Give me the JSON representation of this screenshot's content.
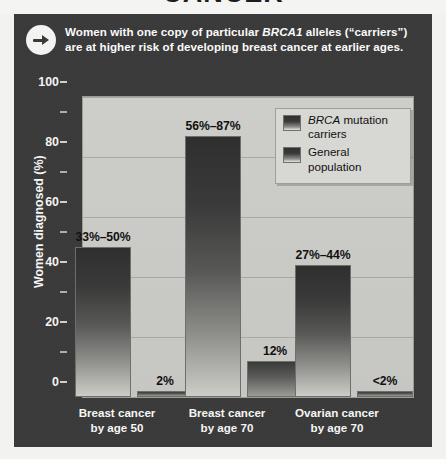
{
  "page": {
    "clipped_title": "CANCER"
  },
  "callout": {
    "icon": "arrow-right-circle-icon",
    "text_part1": "Women with one copy of particular ",
    "text_italic": "BRCA1",
    "text_part2": " alleles (“carriers”) are at higher risk of developing breast cancer at earlier ages."
  },
  "legend": {
    "items": [
      {
        "label_italic": "BRCA",
        "label_rest": " mutation carriers",
        "color": "#303030"
      },
      {
        "label_italic": "",
        "label_rest": "General population",
        "color": "#303030"
      }
    ]
  },
  "chart_data": {
    "type": "bar",
    "title": "CANCER",
    "xlabel": "",
    "ylabel": "Women diagnosed (%)",
    "ylim": [
      0,
      100
    ],
    "yticks": [
      0,
      20,
      40,
      60,
      80,
      100
    ],
    "yticks_minor": [
      10,
      30,
      50,
      70,
      90
    ],
    "grid": true,
    "legend_position": "top-right",
    "categories": [
      "Breast cancer by age 50",
      "Breast cancer by age 70",
      "Ovarian cancer by age 70"
    ],
    "category_lines": [
      [
        "Breast cancer",
        "by age 50"
      ],
      [
        "Breast cancer",
        "by age 70"
      ],
      [
        "Ovarian cancer",
        "by age 70"
      ]
    ],
    "series": [
      {
        "name": "BRCA mutation carriers",
        "values": [
          50,
          87,
          44
        ],
        "labels": [
          "33%–50%",
          "56%–87%",
          "27%–44%"
        ]
      },
      {
        "name": "General population",
        "values": [
          2,
          12,
          2
        ],
        "labels": [
          "2%",
          "12%",
          "<2%"
        ]
      }
    ]
  },
  "colors": {
    "panel_background": "#3a3a3a",
    "plot_background": "#c9c9c5",
    "bar_dark": "#2f2f2f",
    "text_light": "#f6f6f4",
    "text_dark": "#111111"
  }
}
